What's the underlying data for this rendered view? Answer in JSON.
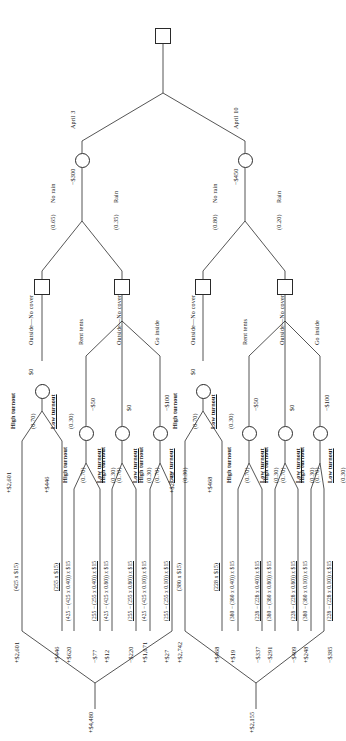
{
  "diagram": {
    "type": "decision-tree",
    "orientation": "rotated-90-ccw"
  },
  "root": {
    "node_type": "decision-square",
    "branches": [
      {
        "label": "April 3",
        "cost": "−$300"
      },
      {
        "label": "April 10",
        "cost": "−$450"
      }
    ]
  },
  "weather": {
    "april3": {
      "no_rain_label": "No rain",
      "no_rain_prob": "(0.65)",
      "rain_label": "Rain",
      "rain_prob": "(0.35)"
    },
    "april10": {
      "no_rain_label": "No rain",
      "no_rain_prob": "(0.80)",
      "rain_label": "Rain",
      "rain_prob": "(0.20)"
    }
  },
  "options": {
    "no_cover": "Outside—No cover",
    "rent_tents": "Rent tents",
    "go_inside": "Go inside"
  },
  "turnout": {
    "high_label": "High turnout",
    "high_prob": "(0.70)",
    "low_label": "Low turnout",
    "low_prob": "(0.30)"
  },
  "april3": {
    "ev_root": "+$4,480",
    "no_rain": {
      "option": "Outside—No cover",
      "cost": "$0",
      "ev": "+$2,601",
      "high": {
        "expr": "(425 x $15)",
        "value": "+$2,601"
      },
      "low": {
        "expr": "(255 x $15)",
        "value": "+$446"
      }
    },
    "rain": {
      "branches": [
        {
          "option": "Rent tents",
          "cost": "−$50",
          "high": {
            "expr": "(425 − (425 x 0.40)) x $15",
            "value": "+$620"
          },
          "low": {
            "expr": "(255 − (255 x 0.40)) x $15",
            "value": "−$77"
          }
        },
        {
          "option": "Outside—No cover",
          "cost": "$0",
          "high": {
            "expr": "(425 − (425 x 0.80)) x $15",
            "value": "+$12"
          },
          "low": {
            "expr": "(255 − (255 x 0.80)) x $15",
            "value": "−$220"
          }
        },
        {
          "option": "Go inside",
          "cost": "−$100",
          "high": {
            "expr": "(425 − (425 x 0.10)) x $15",
            "value": "+$1,071"
          },
          "low": {
            "expr": "(255 − (255 x 0.10)) x $15",
            "value": "+$27"
          }
        }
      ]
    }
  },
  "april10": {
    "ev_root": "+$2,155",
    "no_rain": {
      "option": "Outside—No cover",
      "cost": "$0",
      "ev": "+$2,742",
      "high": {
        "expr": "(380 x $15)",
        "value": "+$2,742"
      },
      "low": {
        "expr": "(228 x $15)",
        "value": "+$468"
      }
    },
    "rain": {
      "branches": [
        {
          "option": "Rent tents",
          "cost": "−$50",
          "high": {
            "expr": "(380 − (380 x 0.40)) x $15",
            "value": "+$19"
          },
          "low": {
            "expr": "(228 − (228 x 0.40)) x $15",
            "value": "−$337"
          }
        },
        {
          "option": "Outside—No cover",
          "cost": "$0",
          "high": {
            "expr": "(380 − (380 x 0.80)) x $15",
            "value": "−$291"
          },
          "low": {
            "expr": "(228 − (228 x 0.80)) x $15",
            "value": "−$409"
          }
        },
        {
          "option": "Go inside",
          "cost": "−$100",
          "high": {
            "expr": "(380 − (380 x 0.10)) x $15",
            "value": "+$248"
          },
          "low": {
            "expr": "(228 − (228 x 0.10)) x $15",
            "value": "−$385"
          }
        }
      ]
    }
  }
}
